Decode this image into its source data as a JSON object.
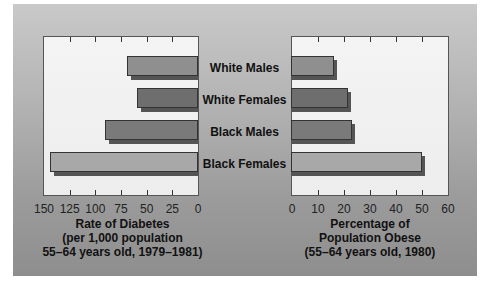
{
  "chart_data": [
    {
      "type": "bar",
      "orientation": "horizontal",
      "direction": "right-to-left",
      "categories": [
        "White Males",
        "White Females",
        "Black Males",
        "Black Females"
      ],
      "values": [
        69,
        59,
        91,
        144
      ],
      "xlabel": "Rate of Diabetes (per 1,000 population 55–64 years old, 1979–1981)",
      "xlim": [
        150,
        0
      ],
      "xticks": [
        150,
        125,
        100,
        75,
        50,
        25,
        0
      ],
      "grid": false
    },
    {
      "type": "bar",
      "orientation": "horizontal",
      "categories": [
        "White Males",
        "White Females",
        "Black Males",
        "Black Females"
      ],
      "values": [
        16,
        21.5,
        23,
        50
      ],
      "xlabel": "Percentage of Population Obese (55–64 years old, 1980)",
      "xlim": [
        0,
        60
      ],
      "xticks": [
        0,
        10,
        20,
        30,
        40,
        50,
        60
      ],
      "grid": false
    }
  ],
  "categories": [
    "White Males",
    "White Females",
    "Black Males",
    "Black Females"
  ],
  "left": {
    "ticks": [
      "150",
      "125",
      "100",
      "75",
      "50",
      "25",
      "0"
    ],
    "title_lines": [
      "Rate of Diabetes",
      "(per 1,000 population",
      "55–64 years old, 1979–1981)"
    ]
  },
  "right": {
    "ticks": [
      "0",
      "10",
      "20",
      "30",
      "40",
      "50",
      "60"
    ],
    "title_lines": [
      "Percentage of",
      "Population Obese",
      "(55–64 years old, 1980)"
    ]
  },
  "colors": {
    "white_males": "#8f8f8f",
    "white_females": "#6e6e6e",
    "black_males": "#7a7a7a",
    "black_females": "#a8a8a8",
    "shadow": "#555555"
  }
}
